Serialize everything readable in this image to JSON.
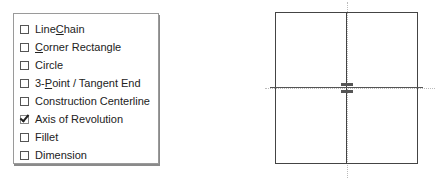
{
  "menu": {
    "items": [
      {
        "pre": "Line ",
        "u": "C",
        "post": "hain",
        "checked": false
      },
      {
        "pre": "",
        "u": "C",
        "post": "orner Rectangle",
        "checked": false
      },
      {
        "pre": "Circle",
        "u": "",
        "post": "",
        "checked": false
      },
      {
        "pre": "3-",
        "u": "P",
        "post": "oint / Tangent End",
        "checked": false
      },
      {
        "pre": "Construction Centerline",
        "u": "",
        "post": "",
        "checked": false
      },
      {
        "pre": "Axis of Revolution",
        "u": "",
        "post": "",
        "checked": true
      },
      {
        "pre": "Fillet",
        "u": "",
        "post": "",
        "checked": false
      },
      {
        "pre": "Dimension",
        "u": "",
        "post": "",
        "checked": false
      }
    ]
  },
  "drawing": {
    "description": "rectangle split by vertical axis of revolution and horizontal centerline"
  }
}
